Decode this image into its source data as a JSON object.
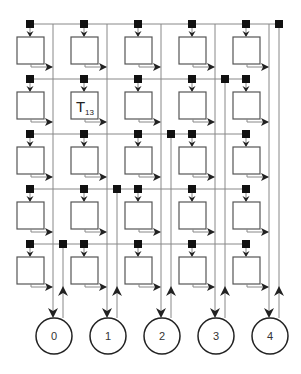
{
  "diagram": {
    "rows": 5,
    "cols": 5,
    "col_x": [
      30,
      84,
      138,
      192,
      246
    ],
    "row_y": [
      24,
      79,
      134,
      189,
      244
    ],
    "labeled_cell": {
      "row": 1,
      "col": 1,
      "label": "T",
      "subscript": "13"
    },
    "nodes": [
      {
        "id": 0,
        "label": "0"
      },
      {
        "id": 1,
        "label": "1"
      },
      {
        "id": 2,
        "label": "2"
      },
      {
        "id": 3,
        "label": "3"
      },
      {
        "id": 4,
        "label": "4"
      }
    ],
    "colors": {
      "line": "#888888",
      "box": "#555555",
      "square": "#111111",
      "circle": "#222222"
    }
  }
}
